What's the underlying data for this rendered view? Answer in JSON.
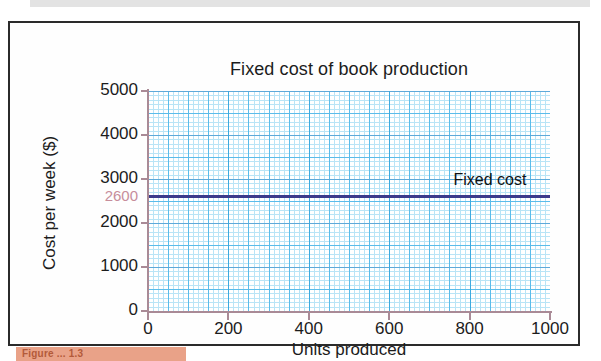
{
  "figure": {
    "caption": "Figure ... 1.3",
    "border_color": "#2b2b2b"
  },
  "chart_data": {
    "type": "line",
    "title": "Fixed cost of book production",
    "xlabel": "Units produced",
    "ylabel": "Cost per week ($)",
    "xlim": [
      0,
      1000
    ],
    "ylim": [
      0,
      5000
    ],
    "xticks": [
      "0",
      "200",
      "400",
      "600",
      "800",
      "1000"
    ],
    "xtick_values": [
      0,
      200,
      400,
      600,
      800,
      1000
    ],
    "yticks": [
      "0",
      "1000",
      "2000",
      "3000",
      "4000",
      "5000"
    ],
    "ytick_values": [
      0,
      1000,
      2000,
      3000,
      4000,
      5000
    ],
    "highlighted_ytick": "2600",
    "highlighted_ytick_value": 2600,
    "highlighted_ytick_color": "#c78d9b",
    "grid": true,
    "grid_style": "graph-paper",
    "grid_minor_color": "#8fd4f2",
    "grid_major_color": "#4ab6e8",
    "axis_color": "#a98a96",
    "legend_position": "inline-annotation",
    "series": [
      {
        "name": "Fixed cost",
        "color": "#3c3b8c",
        "constant_value": 2600,
        "x": [
          0,
          1000
        ],
        "values": [
          2600,
          2600
        ]
      }
    ]
  }
}
